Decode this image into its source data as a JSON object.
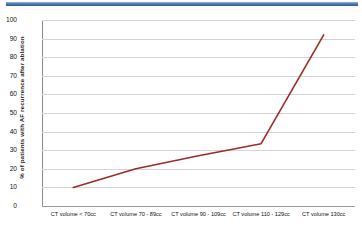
{
  "decor": {
    "top_bar_color": "#2e5b92"
  },
  "chart_data": {
    "type": "line",
    "title": "",
    "xlabel": "",
    "ylabel": "% of patients with AF recurrence after ablation",
    "categories": [
      "CT volume < 70cc",
      "CT volume 70 - 89cc",
      "CT volume 90 - 109cc",
      "CT volume 110 - 129cc",
      "CT volume   130cc"
    ],
    "values": [
      10,
      20,
      27,
      33.5,
      92
    ],
    "series": [
      {
        "name": "% of patients with AF recurrence after ablation",
        "values": [
          10,
          20,
          27,
          33.5,
          92
        ],
        "color": "#9e2b25"
      }
    ],
    "ylim": [
      0,
      100
    ],
    "y_ticks": [
      0,
      10,
      20,
      30,
      40,
      50,
      60,
      70,
      80,
      90,
      100
    ],
    "y_tick_labels": [
      "0",
      "10",
      "20",
      "30",
      "40",
      "50",
      "60",
      "70",
      "80",
      "90",
      "100"
    ],
    "grid": true,
    "legend": "none",
    "line_color": "#9e2b25",
    "gridline_color": "#d4d4d4",
    "axis_color": "#8d8d8d"
  }
}
